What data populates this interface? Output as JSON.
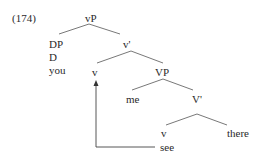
{
  "example_number": "(174)",
  "tree": {
    "root": "vP",
    "nodes": {
      "vP": "vP",
      "DP": "DP",
      "D": "D",
      "you": "you",
      "v_bar": "v'",
      "v_upper": "v",
      "VP": "VP",
      "me": "me",
      "V_bar": "V'",
      "v_lower": "v",
      "there": "there",
      "see": "see"
    },
    "movement": {
      "from": "see",
      "to": "v_upper"
    }
  },
  "colors": {
    "ink": "#2a2a2a",
    "line": "#555555"
  }
}
